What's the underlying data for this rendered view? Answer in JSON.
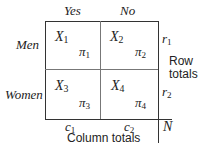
{
  "diagram": {
    "type": "contingency-table",
    "column_headers": [
      "Yes",
      "No"
    ],
    "row_headers": [
      "Men",
      "Women"
    ],
    "cells": [
      {
        "count": "X",
        "count_sub": "1",
        "prob": "π",
        "prob_sub": "1"
      },
      {
        "count": "X",
        "count_sub": "2",
        "prob": "π",
        "prob_sub": "2"
      },
      {
        "count": "X",
        "count_sub": "3",
        "prob": "π",
        "prob_sub": "3"
      },
      {
        "count": "X",
        "count_sub": "4",
        "prob": "π",
        "prob_sub": "4"
      }
    ],
    "row_totals": [
      {
        "sym": "r",
        "sub": "1"
      },
      {
        "sym": "r",
        "sub": "2"
      }
    ],
    "column_totals": [
      {
        "sym": "c",
        "sub": "1"
      },
      {
        "sym": "c",
        "sub": "2"
      }
    ],
    "grand_total": "N",
    "row_totals_label_line1": "Row",
    "row_totals_label_line2": "totals",
    "column_totals_label": "Column totals"
  }
}
